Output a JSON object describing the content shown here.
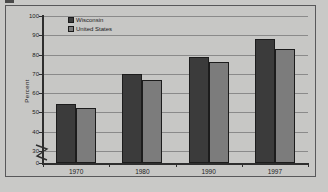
{
  "chart_data": {
    "type": "bar",
    "title": "",
    "xlabel": "",
    "ylabel": "Percent",
    "categories": [
      "1970",
      "1980",
      "1990",
      "1997"
    ],
    "series": [
      {
        "name": "Wisconsin",
        "values": [
          54.5,
          70,
          79,
          88
        ],
        "color": "#3b3b3b"
      },
      {
        "name": "United States",
        "values": [
          52.5,
          67,
          76,
          83
        ],
        "color": "#7c7c7c"
      }
    ],
    "ylim": [
      0,
      100
    ],
    "yticks": [
      0,
      30,
      40,
      50,
      60,
      70,
      80,
      90,
      100
    ],
    "ytick_labels": [
      "0",
      "30",
      "40",
      "50",
      "60",
      "70",
      "80",
      "90",
      "100"
    ],
    "axis_break": true,
    "axis_break_between": [
      0,
      30
    ],
    "grid": true,
    "grid_axis": "y",
    "legend_position": "top-left",
    "legend": [
      "Wisconsin",
      "United States"
    ]
  },
  "colors": {
    "page_background": "#c9c9c7",
    "plot_background": "#c7c7c5",
    "frame_border": "#58585a",
    "axis": "#2e2e2e",
    "grid": "#8a8a8a",
    "text": "#1d1d1d",
    "series_wisconsin": "#3b3b3b",
    "series_united_states": "#7c7c7c"
  }
}
